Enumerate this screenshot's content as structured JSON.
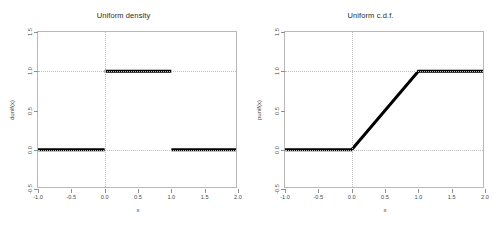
{
  "figure": {
    "background": "#ffffff",
    "frame_color": "#b9b9b9",
    "grid_color": "#bdbdbd",
    "line_color": "#000000",
    "width": 494,
    "height": 226
  },
  "chart_data": [
    {
      "type": "line",
      "title": "Uniform density",
      "xlabel": "x",
      "ylabel": "dunif(x)",
      "xlim": [
        -1.0,
        2.0
      ],
      "ylim": [
        -0.5,
        1.5
      ],
      "xticks": [
        -1.0,
        -0.5,
        0.0,
        0.5,
        1.0,
        1.5,
        2.0
      ],
      "xticklabels": [
        "-1.0",
        "-0.5",
        "0.0",
        "0.5",
        "1.0",
        "1.5",
        "2.0"
      ],
      "yticks": [
        -0.5,
        0.0,
        0.5,
        1.0,
        1.5
      ],
      "yticklabels": [
        "-0.5",
        "0.0",
        "0.5",
        "1.0",
        "1.5"
      ],
      "grid": true,
      "gridlines_v": [
        0.0
      ],
      "gridlines_h": [
        0.0,
        1.0
      ],
      "legend": null,
      "segments": [
        {
          "name": "left-zero-segment",
          "x": [
            -1.0,
            0.0
          ],
          "y": [
            0.0,
            0.0
          ]
        },
        {
          "name": "density-plateau-segment",
          "x": [
            0.0,
            1.0
          ],
          "y": [
            1.0,
            1.0
          ]
        },
        {
          "name": "right-zero-segment",
          "x": [
            1.0,
            2.0
          ],
          "y": [
            0.0,
            0.0
          ]
        }
      ]
    },
    {
      "type": "line",
      "title": "Uniform c.d.f.",
      "xlabel": "x",
      "ylabel": "punif(x)",
      "xlim": [
        -1.0,
        2.0
      ],
      "ylim": [
        -0.5,
        1.5
      ],
      "xticks": [
        -1.0,
        -0.5,
        0.0,
        0.5,
        1.0,
        1.5,
        2.0
      ],
      "xticklabels": [
        "-1.0",
        "-0.5",
        "0.0",
        "0.5",
        "1.0",
        "1.5",
        "2.0"
      ],
      "yticks": [
        -0.5,
        0.0,
        0.5,
        1.0,
        1.5
      ],
      "yticklabels": [
        "-0.5",
        "0.0",
        "0.5",
        "1.0",
        "1.5"
      ],
      "grid": true,
      "gridlines_v": [
        0.0
      ],
      "gridlines_h": [
        0.0,
        1.0
      ],
      "legend": null,
      "polyline": {
        "name": "cdf-polyline",
        "x": [
          -1.0,
          0.0,
          1.0,
          2.0
        ],
        "y": [
          0.0,
          0.0,
          1.0,
          1.0
        ]
      }
    }
  ]
}
